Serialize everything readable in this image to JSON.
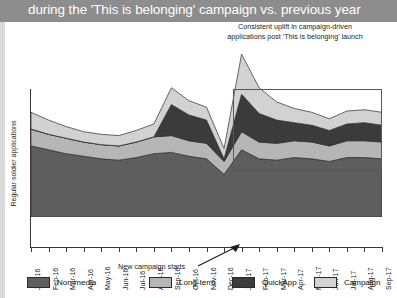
{
  "banner": {
    "title": "during the 'This is belonging' campaign vs. previous year"
  },
  "annotations": {
    "callout_line1": "Consistent uplift in campaign-driven",
    "callout_line2": "applications post 'This is belonging' launch",
    "campaign_start": "New campaign starts",
    "arrow_icon": "arrow-up-right-icon"
  },
  "legend": {
    "items": [
      {
        "label": "Non-media",
        "color": "#5e5e5e"
      },
      {
        "label": "Long-term",
        "color": "#b6b6b6"
      },
      {
        "label": "QuickApp",
        "color": "#3b3b3b"
      },
      {
        "label": "Campaign",
        "color": "#d2d2d2"
      }
    ]
  },
  "chart_data": {
    "type": "area",
    "stacked": true,
    "title": "during the 'This is belonging' campaign vs. previous year",
    "xlabel": "",
    "ylabel": "Regular soldier applications",
    "grid": false,
    "legend_position": "bottom",
    "categories": [
      "Jan-16",
      "Feb-16",
      "Mar-16",
      "Apr-16",
      "May-16",
      "Jun-16",
      "Jul-16",
      "Aug-16",
      "Sep-16",
      "Oct-16",
      "Nov-16",
      "Dec-16",
      "Jan-17",
      "Feb-17",
      "Mar-17",
      "Apr-17",
      "May-17",
      "Jun-17",
      "Jul-17",
      "Aug-17",
      "Sep-17"
    ],
    "series": [
      {
        "name": "Non-media",
        "color": "#5e5e5e",
        "values": [
          55,
          52,
          49,
          47,
          45,
          44,
          46,
          49,
          50,
          47,
          45,
          33,
          52,
          45,
          44,
          46,
          45,
          43,
          46,
          46,
          45
        ]
      },
      {
        "name": "Long-term",
        "color": "#b6b6b6",
        "values": [
          13,
          12,
          12,
          11,
          11,
          11,
          12,
          13,
          13,
          12,
          12,
          10,
          14,
          13,
          13,
          13,
          13,
          12,
          13,
          13,
          13
        ]
      },
      {
        "name": "QuickApp",
        "color": "#3b3b3b",
        "values": [
          0,
          0,
          0,
          0,
          0,
          0,
          0,
          0,
          24,
          20,
          18,
          2,
          29,
          22,
          18,
          14,
          13,
          12,
          13,
          14,
          13
        ]
      },
      {
        "name": "Campaign",
        "color": "#d2d2d2",
        "values": [
          13,
          11,
          9,
          8,
          8,
          8,
          9,
          10,
          13,
          11,
          10,
          8,
          31,
          20,
          14,
          11,
          10,
          9,
          10,
          10,
          10
        ]
      }
    ],
    "ylim": [
      0,
      130
    ],
    "highlight_region": {
      "from": "Jan-17",
      "to": "Sep-17"
    }
  }
}
